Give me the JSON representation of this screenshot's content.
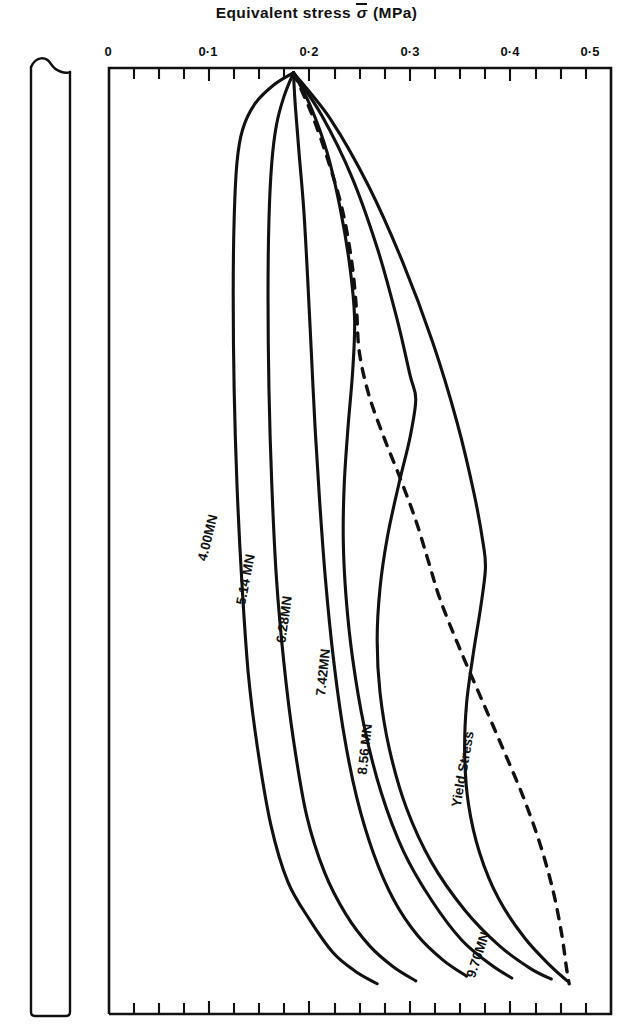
{
  "chart_title": {
    "prefix": "Equivalent stress ",
    "symbol": "σ",
    "suffix": " (MPa)"
  },
  "axis": {
    "tick_labels": [
      "0",
      "0·1",
      "0·2",
      "0·3",
      "0·4",
      "0·5"
    ],
    "tick_values": [
      0,
      0.1,
      0.2,
      0.3,
      0.4,
      0.5
    ]
  },
  "curve_labels": [
    {
      "text": "4.00MN"
    },
    {
      "text": "5.14 MN"
    },
    {
      "text": "6.28MN"
    },
    {
      "text": "7.42MN"
    },
    {
      "text": "8.56 MN"
    },
    {
      "text": "9.70MN"
    },
    {
      "text": "Yield Stress"
    }
  ],
  "colors": {
    "ink": "#111111",
    "background": "#ffffff"
  },
  "chart_data": {
    "type": "line",
    "xlabel": "Equivalent stress σ̄ (MPa)",
    "ylabel": "Position along specimen (depth)",
    "xlim": [
      0,
      0.5335
    ],
    "ylim": [
      0,
      1
    ],
    "grid": false,
    "legend": "inline-curve-labels",
    "x_tick_labels": [
      "0",
      "0·1",
      "0·2",
      "0·3",
      "0·4",
      "0·5"
    ],
    "x_ticks_major": [
      0,
      0.1,
      0.2,
      0.3,
      0.4,
      0.5
    ],
    "x_minor_tick_interval": 0.025,
    "y_axis_ticks": "none",
    "series": [
      {
        "name": "4.00MN",
        "style": "solid",
        "points": [
          [
            0.196,
            0.005
          ],
          [
            0.175,
            0.018
          ],
          [
            0.155,
            0.038
          ],
          [
            0.142,
            0.065
          ],
          [
            0.136,
            0.1
          ],
          [
            0.133,
            0.16
          ],
          [
            0.132,
            0.24
          ],
          [
            0.133,
            0.34
          ],
          [
            0.136,
            0.44
          ],
          [
            0.141,
            0.54
          ],
          [
            0.148,
            0.64
          ],
          [
            0.158,
            0.72
          ],
          [
            0.172,
            0.8
          ],
          [
            0.19,
            0.86
          ],
          [
            0.213,
            0.9
          ],
          [
            0.238,
            0.935
          ],
          [
            0.262,
            0.955
          ],
          [
            0.285,
            0.968
          ]
        ]
      },
      {
        "name": "5.14 MN",
        "style": "solid",
        "points": [
          [
            0.196,
            0.005
          ],
          [
            0.186,
            0.03
          ],
          [
            0.178,
            0.06
          ],
          [
            0.173,
            0.1
          ],
          [
            0.17,
            0.16
          ],
          [
            0.169,
            0.24
          ],
          [
            0.17,
            0.34
          ],
          [
            0.173,
            0.44
          ],
          [
            0.178,
            0.54
          ],
          [
            0.186,
            0.63
          ],
          [
            0.196,
            0.71
          ],
          [
            0.21,
            0.79
          ],
          [
            0.229,
            0.85
          ],
          [
            0.252,
            0.895
          ],
          [
            0.277,
            0.928
          ],
          [
            0.302,
            0.95
          ],
          [
            0.326,
            0.965
          ]
        ]
      },
      {
        "name": "6.28MN",
        "style": "solid",
        "points": [
          [
            0.196,
            0.005
          ],
          [
            0.198,
            0.04
          ],
          [
            0.202,
            0.09
          ],
          [
            0.207,
            0.15
          ],
          [
            0.211,
            0.22
          ],
          [
            0.215,
            0.3
          ],
          [
            0.219,
            0.38
          ],
          [
            0.224,
            0.46
          ],
          [
            0.23,
            0.54
          ],
          [
            0.238,
            0.62
          ],
          [
            0.249,
            0.7
          ],
          [
            0.263,
            0.77
          ],
          [
            0.281,
            0.83
          ],
          [
            0.303,
            0.88
          ],
          [
            0.328,
            0.917
          ],
          [
            0.355,
            0.943
          ],
          [
            0.38,
            0.96
          ]
        ]
      },
      {
        "name": "7.42MN",
        "style": "solid",
        "points": [
          [
            0.196,
            0.005
          ],
          [
            0.214,
            0.04
          ],
          [
            0.232,
            0.09
          ],
          [
            0.246,
            0.15
          ],
          [
            0.256,
            0.21
          ],
          [
            0.261,
            0.265
          ],
          [
            0.259,
            0.32
          ],
          [
            0.254,
            0.38
          ],
          [
            0.25,
            0.44
          ],
          [
            0.249,
            0.5
          ],
          [
            0.252,
            0.56
          ],
          [
            0.259,
            0.625
          ],
          [
            0.271,
            0.695
          ],
          [
            0.289,
            0.765
          ],
          [
            0.313,
            0.828
          ],
          [
            0.343,
            0.88
          ],
          [
            0.375,
            0.922
          ],
          [
            0.406,
            0.948
          ],
          [
            0.428,
            0.962
          ]
        ]
      },
      {
        "name": "8.56 MN",
        "style": "solid",
        "points": [
          [
            0.196,
            0.005
          ],
          [
            0.226,
            0.05
          ],
          [
            0.258,
            0.115
          ],
          [
            0.285,
            0.19
          ],
          [
            0.306,
            0.265
          ],
          [
            0.32,
            0.325
          ],
          [
            0.326,
            0.35
          ],
          [
            0.32,
            0.39
          ],
          [
            0.308,
            0.44
          ],
          [
            0.296,
            0.495
          ],
          [
            0.288,
            0.55
          ],
          [
            0.285,
            0.605
          ],
          [
            0.288,
            0.66
          ],
          [
            0.298,
            0.72
          ],
          [
            0.316,
            0.782
          ],
          [
            0.343,
            0.84
          ],
          [
            0.378,
            0.89
          ],
          [
            0.415,
            0.928
          ],
          [
            0.448,
            0.952
          ],
          [
            0.47,
            0.963
          ]
        ]
      },
      {
        "name": "9.70MN",
        "style": "solid",
        "points": [
          [
            0.196,
            0.005
          ],
          [
            0.236,
            0.055
          ],
          [
            0.276,
            0.125
          ],
          [
            0.312,
            0.205
          ],
          [
            0.344,
            0.29
          ],
          [
            0.37,
            0.375
          ],
          [
            0.388,
            0.45
          ],
          [
            0.398,
            0.505
          ],
          [
            0.4,
            0.53
          ],
          [
            0.395,
            0.57
          ],
          [
            0.387,
            0.62
          ],
          [
            0.38,
            0.672
          ],
          [
            0.378,
            0.725
          ],
          [
            0.382,
            0.778
          ],
          [
            0.394,
            0.83
          ],
          [
            0.414,
            0.878
          ],
          [
            0.442,
            0.92
          ],
          [
            0.47,
            0.95
          ],
          [
            0.487,
            0.965
          ]
        ]
      },
      {
        "name": "Yield Stress",
        "style": "dashed",
        "points": [
          [
            0.196,
            0.005
          ],
          [
            0.214,
            0.045
          ],
          [
            0.232,
            0.095
          ],
          [
            0.248,
            0.15
          ],
          [
            0.258,
            0.205
          ],
          [
            0.263,
            0.255
          ],
          [
            0.266,
            0.3
          ],
          [
            0.276,
            0.345
          ],
          [
            0.292,
            0.39
          ],
          [
            0.31,
            0.435
          ],
          [
            0.326,
            0.478
          ],
          [
            0.339,
            0.52
          ],
          [
            0.352,
            0.562
          ],
          [
            0.372,
            0.612
          ],
          [
            0.395,
            0.665
          ],
          [
            0.418,
            0.718
          ],
          [
            0.44,
            0.77
          ],
          [
            0.458,
            0.82
          ],
          [
            0.472,
            0.87
          ],
          [
            0.481,
            0.915
          ],
          [
            0.486,
            0.95
          ],
          [
            0.489,
            0.968
          ]
        ]
      }
    ]
  }
}
